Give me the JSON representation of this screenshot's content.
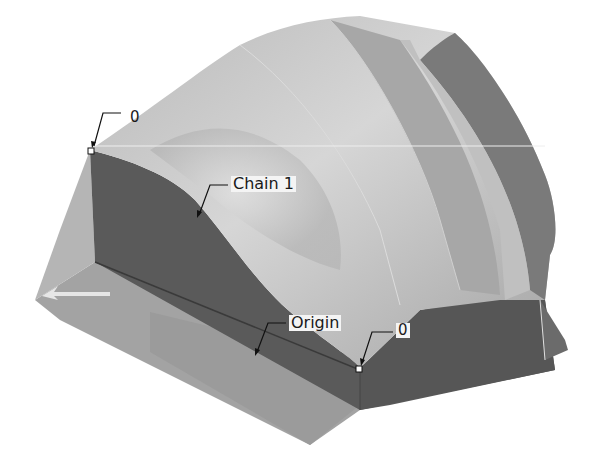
{
  "figure": {
    "background": "#ffffff",
    "colors": {
      "top_surface_light": "#c9c9c9",
      "top_surface_mid": "#a9a9a9",
      "side_dark": "#5c5c5c",
      "side_darker": "#4a4a4a",
      "front_face": "#9a9a9a",
      "edge_highlight": "#e8e8e8"
    }
  },
  "annotations": {
    "start_point_label": "0",
    "chain_label": "Chain 1",
    "origin_label": "Origin",
    "end_point_label": "0"
  }
}
